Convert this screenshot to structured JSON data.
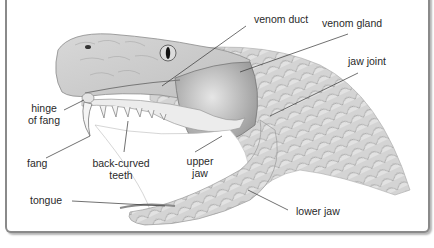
{
  "diagram": {
    "labels": {
      "venom_duct": "venom duct",
      "venom_gland": "venom gland",
      "jaw_joint": "jaw joint",
      "hinge_line1": "hinge",
      "hinge_line2": "of fang",
      "fang": "fang",
      "teeth_line1": "back-curved",
      "teeth_line2": "teeth",
      "upper_jaw_line1": "upper",
      "upper_jaw_line2": "jaw",
      "tongue": "tongue",
      "lower_jaw": "lower jaw"
    },
    "colors": {
      "frame": "#8a8a8a",
      "leader": "#333333",
      "scales": "#c8c8c8",
      "gland": "#9a9a9a"
    }
  }
}
